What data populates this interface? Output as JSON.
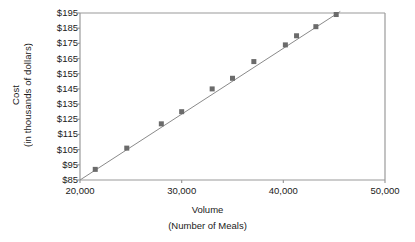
{
  "chart_data": {
    "type": "scatter",
    "title": "",
    "xlabel": "Volume",
    "xlabel_sub": "(Number of Meals)",
    "ylabel": "Cost",
    "ylabel_sub": "(in thousands of dollars)",
    "xlim": [
      20000,
      50000
    ],
    "ylim": [
      85,
      195
    ],
    "xticks": [
      20000,
      30000,
      40000,
      50000
    ],
    "xtick_labels": [
      "20,000",
      "30,000",
      "40,000",
      "50,000"
    ],
    "yticks": [
      85,
      95,
      105,
      115,
      125,
      135,
      145,
      155,
      165,
      175,
      185,
      195
    ],
    "ytick_labels": [
      "$85",
      "$95",
      "$105",
      "$115",
      "$125",
      "$135",
      "$145",
      "$155",
      "$165",
      "$175",
      "$185",
      "$195"
    ],
    "grid": false,
    "legend": false,
    "marker_color": "#6b6b6b",
    "line_color": "#8a8a8a",
    "axis_color": "#9a9a9a",
    "series": [
      {
        "name": "Cost vs Volume",
        "marker": "square",
        "points": [
          {
            "x": 21500,
            "y": 92
          },
          {
            "x": 24600,
            "y": 106
          },
          {
            "x": 28000,
            "y": 122
          },
          {
            "x": 30000,
            "y": 130
          },
          {
            "x": 33000,
            "y": 145
          },
          {
            "x": 35000,
            "y": 152
          },
          {
            "x": 37100,
            "y": 163
          },
          {
            "x": 40200,
            "y": 174
          },
          {
            "x": 41300,
            "y": 180
          },
          {
            "x": 43200,
            "y": 186
          },
          {
            "x": 45200,
            "y": 194
          }
        ]
      }
    ],
    "trendline": {
      "name": "regression-line",
      "x_start": 20000,
      "y_start": 85,
      "x_end": 45600,
      "y_end": 196
    }
  }
}
